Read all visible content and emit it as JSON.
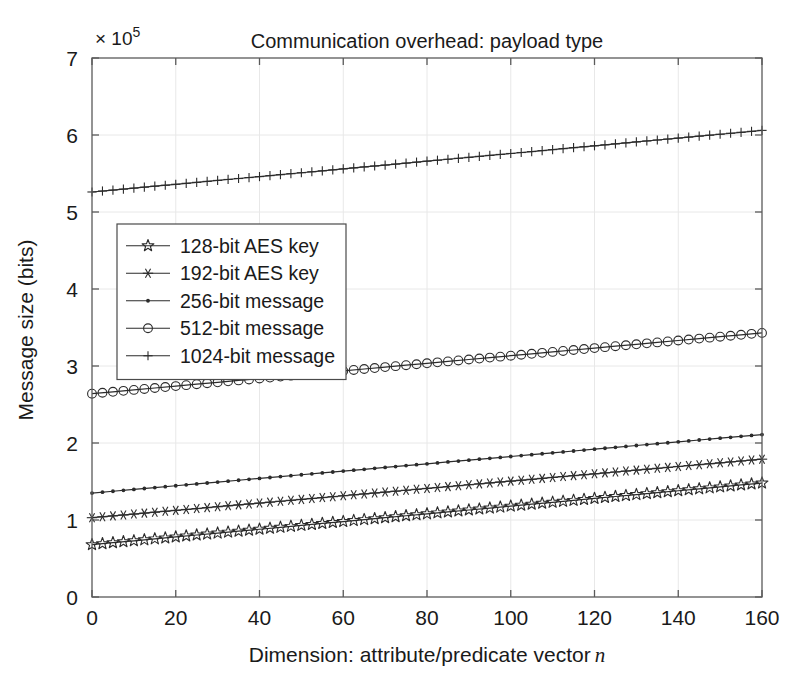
{
  "chart_data": {
    "type": "line",
    "title": "Communication overhead: payload type",
    "xlabel": "Dimension: attribute/predicate vector n",
    "ylabel": "Message size (bits)",
    "y_multiplier": "× 10",
    "y_multiplier_exponent": "5",
    "xlim": [
      0,
      160
    ],
    "ylim": [
      0,
      7
    ],
    "xticks": [
      0,
      20,
      40,
      60,
      80,
      100,
      120,
      140,
      160
    ],
    "yticks": [
      0,
      1,
      2,
      3,
      4,
      5,
      6,
      7
    ],
    "grid": true,
    "legend_position": "upper left",
    "x": [
      0,
      5,
      10,
      15,
      20,
      25,
      30,
      35,
      40,
      45,
      50,
      55,
      60,
      65,
      70,
      75,
      80,
      85,
      90,
      95,
      100,
      105,
      110,
      115,
      120,
      125,
      130,
      135,
      140,
      145,
      150,
      155,
      160
    ],
    "series": [
      {
        "name": "128-bit AES key",
        "marker": "pentagram-star",
        "values": [
          0.68,
          0.705,
          0.73,
          0.755,
          0.78,
          0.805,
          0.83,
          0.855,
          0.88,
          0.905,
          0.93,
          0.955,
          0.98,
          1.005,
          1.03,
          1.055,
          1.08,
          1.105,
          1.13,
          1.155,
          1.18,
          1.205,
          1.23,
          1.255,
          1.28,
          1.305,
          1.33,
          1.355,
          1.38,
          1.405,
          1.43,
          1.455,
          1.48
        ]
      },
      {
        "name": "192-bit AES key",
        "marker": "asterisk",
        "values": [
          1.03,
          1.0537,
          1.0775,
          1.1012,
          1.125,
          1.1487,
          1.1725,
          1.1962,
          1.22,
          1.2437,
          1.2675,
          1.2912,
          1.315,
          1.3387,
          1.3625,
          1.3862,
          1.41,
          1.4337,
          1.4575,
          1.4812,
          1.505,
          1.5287,
          1.5525,
          1.5762,
          1.6,
          1.6237,
          1.6475,
          1.6712,
          1.695,
          1.7187,
          1.7425,
          1.7662,
          1.79
        ]
      },
      {
        "name": "256-bit message",
        "marker": "dot",
        "values": [
          1.35,
          1.3737,
          1.3975,
          1.4212,
          1.445,
          1.4687,
          1.4925,
          1.5162,
          1.54,
          1.5637,
          1.5875,
          1.6112,
          1.635,
          1.6587,
          1.6825,
          1.7062,
          1.73,
          1.7537,
          1.7775,
          1.8012,
          1.825,
          1.8487,
          1.8725,
          1.8962,
          1.92,
          1.9437,
          1.9675,
          1.9912,
          2.015,
          2.0387,
          2.0625,
          2.0862,
          2.11
        ]
      },
      {
        "name": "512-bit message",
        "marker": "circle",
        "values": [
          2.64,
          2.6647,
          2.6894,
          2.7141,
          2.7388,
          2.7634,
          2.7881,
          2.8128,
          2.8375,
          2.8622,
          2.8869,
          2.9116,
          2.9362,
          2.9609,
          2.9856,
          3.0103,
          3.035,
          3.0597,
          3.0844,
          3.1091,
          3.1337,
          3.1584,
          3.1831,
          3.2078,
          3.2325,
          3.2572,
          3.2819,
          3.3066,
          3.3312,
          3.3559,
          3.3806,
          3.4053,
          3.43
        ]
      },
      {
        "name": "1024-bit message",
        "marker": "plus",
        "values": [
          5.26,
          5.285,
          5.31,
          5.335,
          5.36,
          5.385,
          5.41,
          5.435,
          5.46,
          5.485,
          5.51,
          5.535,
          5.56,
          5.585,
          5.61,
          5.635,
          5.66,
          5.685,
          5.71,
          5.735,
          5.76,
          5.785,
          5.81,
          5.835,
          5.86,
          5.885,
          5.91,
          5.935,
          5.96,
          5.985,
          6.01,
          6.035,
          6.06
        ]
      }
    ]
  },
  "colors": {
    "line": "#2b2b2b",
    "grid": "#e8e8e8",
    "axis": "#5a5a5a",
    "text": "#1a1a1a",
    "background": "#ffffff"
  }
}
